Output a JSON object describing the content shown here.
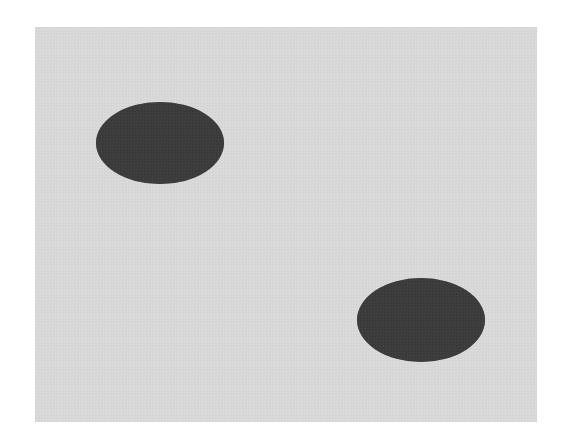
{
  "canvas": {
    "width": 567,
    "height": 445,
    "background_color": "#ffffff",
    "description": "Scanned halftone figure showing two dark filled ellipses on a light gray rectangular field"
  },
  "panel": {
    "name": "gray-field",
    "x": 35,
    "y": 27,
    "width": 502,
    "height": 395,
    "fill_color": "#d8d8d8",
    "texture": "halftone-dither",
    "border": "none"
  },
  "chart_data": {
    "type": "scatter",
    "title": "",
    "subtitle": "",
    "xlabel": "",
    "ylabel": "",
    "grid": false,
    "legend": "none",
    "xlim": [
      35,
      537
    ],
    "ylim": [
      27,
      422
    ],
    "background_color": "#d8d8d8",
    "marker_color": "#3c3c3c",
    "point_count": 2,
    "x": [
      160,
      421
    ],
    "y": [
      143,
      320
    ],
    "shapes": [
      {
        "id": "ellipse-upper-left",
        "label": "Upper-left ellipse",
        "type": "ellipse",
        "cx": 160,
        "cy": 143,
        "rx": 64,
        "ry": 41,
        "fill": "#3c3c3c",
        "rotation": 0
      },
      {
        "id": "ellipse-lower-right",
        "label": "Lower-right ellipse",
        "type": "ellipse",
        "cx": 421,
        "cy": 320,
        "rx": 64,
        "ry": 42,
        "fill": "#3c3c3c",
        "rotation": 0
      }
    ],
    "annotations": []
  },
  "colors": {
    "page": "#ffffff",
    "field": "#d8d8d8",
    "field_dither_light": "#e4e4e4",
    "field_dither_dark": "#c9c9c9",
    "blob": "#3c3c3c",
    "blob_dither_dark": "#2c2c2c",
    "blob_dither_light": "#4e4e4e"
  }
}
